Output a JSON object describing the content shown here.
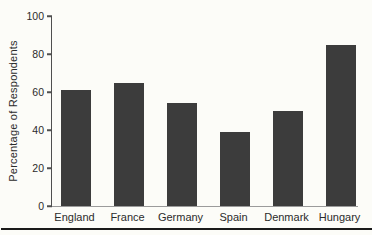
{
  "figure": {
    "background_color": "#fcfcf8",
    "bar_color": "#3c3c3c",
    "axis_color": "#4f4f4f",
    "baseline_color": "#9b9b9b",
    "text_color": "#2b2b2b",
    "bottom_rule_color": "#1a1a1a"
  },
  "chart_data": {
    "type": "bar",
    "categories": [
      "England",
      "France",
      "Germany",
      "Spain",
      "Denmark",
      "Hungary"
    ],
    "values": [
      61,
      65,
      54,
      39,
      50,
      85
    ],
    "title": "",
    "xlabel": "",
    "ylabel": "Percentage of Respondents",
    "ylim": [
      0,
      100
    ],
    "yticks": [
      0,
      20,
      40,
      60,
      80,
      100
    ],
    "grid": false,
    "legend": "none"
  }
}
